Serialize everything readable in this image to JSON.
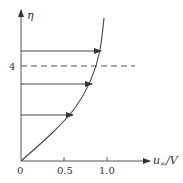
{
  "diagram": {
    "y_axis_label": "η",
    "x_axis_label": "u",
    "x_axis_label_sub": "∞",
    "x_axis_label_suffix": "/V",
    "dashed_level_label": "4",
    "x_ticks": [
      {
        "label": "0",
        "value": 0
      },
      {
        "label": "0.5",
        "value": 0.5
      },
      {
        "label": "1.0",
        "value": 1.0
      }
    ],
    "arrows_count": 3,
    "colors": {
      "line": "#333333",
      "background": "#ffffff"
    }
  }
}
